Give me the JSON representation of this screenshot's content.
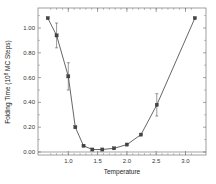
{
  "chart_data": {
    "type": "line",
    "title": "",
    "xlabel": "Temperature",
    "ylabel": "Folding Time (10^8 MC Steps)",
    "ylabel_parts": {
      "pre": "Folding Time (10",
      "sup": "8",
      "post": " MC Steps)"
    },
    "xlim": [
      0.6,
      3.25
    ],
    "ylim": [
      -0.05,
      1.12
    ],
    "xticks": [
      1.0,
      1.5,
      2.0,
      2.5,
      3.0
    ],
    "xtick_labels": [
      "1.0",
      "1.5",
      "2.0",
      "2.5",
      "3.0"
    ],
    "yticks": [
      0.0,
      0.2,
      0.4,
      0.6,
      0.8,
      1.0
    ],
    "ytick_labels": [
      "0.00",
      "0.20",
      "0.40",
      "0.60",
      "0.80",
      "1.00"
    ],
    "grid": false,
    "legend": null,
    "zero_line": true,
    "series": [
      {
        "name": "Folding Time",
        "x": [
          0.65,
          0.8,
          1.0,
          1.12,
          1.26,
          1.41,
          1.58,
          1.78,
          2.0,
          2.24,
          2.51,
          3.16
        ],
        "y": [
          1.08,
          0.94,
          0.61,
          0.2,
          0.05,
          0.02,
          0.02,
          0.03,
          0.06,
          0.14,
          0.38,
          1.08
        ],
        "error": [
          0,
          0.1,
          0.11,
          0,
          0,
          0,
          0,
          0,
          0,
          0,
          0.09,
          0
        ]
      }
    ]
  },
  "colors": {
    "line": "#555555",
    "marker": "#444444",
    "axis": "#666666",
    "text": "#333333"
  }
}
